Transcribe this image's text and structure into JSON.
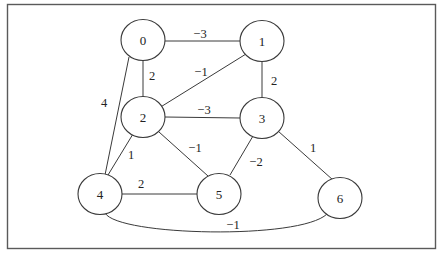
{
  "diagram": {
    "type": "weighted-undirected-graph",
    "nodes": [
      {
        "id": "0",
        "label": "0",
        "cx": 143,
        "cy": 40
      },
      {
        "id": "1",
        "label": "1",
        "cx": 262,
        "cy": 41
      },
      {
        "id": "2",
        "label": "2",
        "cx": 143,
        "cy": 117
      },
      {
        "id": "3",
        "label": "3",
        "cx": 262,
        "cy": 118
      },
      {
        "id": "4",
        "label": "4",
        "cx": 100,
        "cy": 194
      },
      {
        "id": "5",
        "label": "5",
        "cx": 219,
        "cy": 194
      },
      {
        "id": "6",
        "label": "6",
        "cx": 340,
        "cy": 198
      }
    ],
    "edges": [
      {
        "from": "0",
        "to": "1",
        "weight": "−3"
      },
      {
        "from": "0",
        "to": "2",
        "weight": "2"
      },
      {
        "from": "0",
        "to": "4",
        "weight": "4"
      },
      {
        "from": "1",
        "to": "2",
        "weight": "−1"
      },
      {
        "from": "1",
        "to": "3",
        "weight": "2"
      },
      {
        "from": "2",
        "to": "3",
        "weight": "−3"
      },
      {
        "from": "2",
        "to": "4",
        "weight": "1"
      },
      {
        "from": "2",
        "to": "5",
        "weight": "−1"
      },
      {
        "from": "3",
        "to": "5",
        "weight": "−2"
      },
      {
        "from": "3",
        "to": "6",
        "weight": "1"
      },
      {
        "from": "4",
        "to": "5",
        "weight": "2"
      },
      {
        "from": "4",
        "to": "6",
        "weight": "−1"
      }
    ]
  }
}
